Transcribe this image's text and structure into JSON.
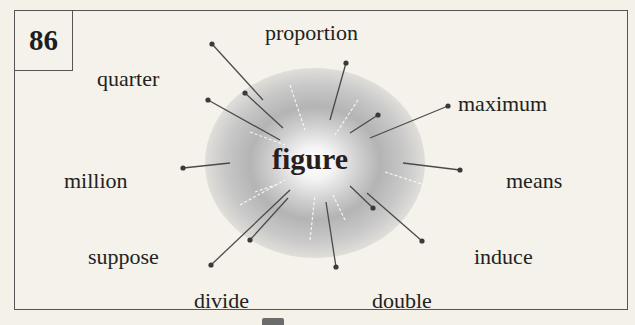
{
  "card": {
    "number": "86",
    "center_word": "figure",
    "related_words": [
      {
        "id": "proportion",
        "label": "proportion",
        "x": 265,
        "y": 6
      },
      {
        "id": "quarter",
        "label": "quarter",
        "x": 97,
        "y": 52
      },
      {
        "id": "maximum",
        "label": "maximum",
        "x": 458,
        "y": 77
      },
      {
        "id": "million",
        "label": "million",
        "x": 64,
        "y": 154
      },
      {
        "id": "means",
        "label": "means",
        "x": 506,
        "y": 154
      },
      {
        "id": "suppose",
        "label": "suppose",
        "x": 88,
        "y": 230
      },
      {
        "id": "induce",
        "label": "induce",
        "x": 474,
        "y": 230
      },
      {
        "id": "divide",
        "label": "divide",
        "x": 194,
        "y": 274
      },
      {
        "id": "double",
        "label": "double",
        "x": 372,
        "y": 274
      }
    ],
    "connectors": [
      {
        "x1": 212,
        "y1": 44,
        "x2": 263,
        "y2": 100
      },
      {
        "x1": 245,
        "y1": 93,
        "x2": 283,
        "y2": 128
      },
      {
        "x1": 208,
        "y1": 100,
        "x2": 280,
        "y2": 140
      },
      {
        "x1": 346,
        "y1": 63,
        "x2": 330,
        "y2": 120
      },
      {
        "x1": 378,
        "y1": 115,
        "x2": 350,
        "y2": 133
      },
      {
        "x1": 448,
        "y1": 106,
        "x2": 370,
        "y2": 138
      },
      {
        "x1": 183,
        "y1": 168,
        "x2": 230,
        "y2": 163
      },
      {
        "x1": 460,
        "y1": 170,
        "x2": 403,
        "y2": 163
      },
      {
        "x1": 211,
        "y1": 265,
        "x2": 290,
        "y2": 190
      },
      {
        "x1": 250,
        "y1": 240,
        "x2": 288,
        "y2": 198
      },
      {
        "x1": 336,
        "y1": 267,
        "x2": 326,
        "y2": 202
      },
      {
        "x1": 373,
        "y1": 208,
        "x2": 350,
        "y2": 186
      },
      {
        "x1": 422,
        "y1": 241,
        "x2": 367,
        "y2": 193
      }
    ],
    "dashes": [
      {
        "x1": 290,
        "y1": 85,
        "x2": 305,
        "y2": 130
      },
      {
        "x1": 358,
        "y1": 100,
        "x2": 335,
        "y2": 135
      },
      {
        "x1": 250,
        "y1": 132,
        "x2": 285,
        "y2": 145
      },
      {
        "x1": 385,
        "y1": 172,
        "x2": 425,
        "y2": 185
      },
      {
        "x1": 240,
        "y1": 205,
        "x2": 285,
        "y2": 180
      },
      {
        "x1": 310,
        "y1": 240,
        "x2": 315,
        "y2": 195
      },
      {
        "x1": 345,
        "y1": 220,
        "x2": 333,
        "y2": 195
      },
      {
        "x1": 255,
        "y1": 192,
        "x2": 275,
        "y2": 185
      }
    ],
    "colors": {
      "line": "#4a4a4a",
      "dot": "#3a3a3a",
      "border": "#555555",
      "background": "#f4f2ea"
    }
  }
}
